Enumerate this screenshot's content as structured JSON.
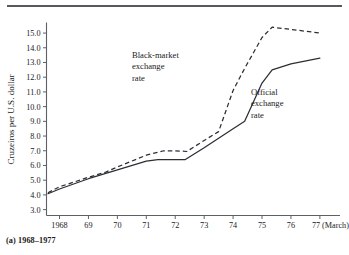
{
  "figure": {
    "caption": "(a) 1968–1977"
  },
  "chart_data": {
    "type": "line",
    "title": "",
    "xlabel": "",
    "ylabel": "Cruzeiros per U.S. dollar",
    "xtick_labels": [
      "1968",
      "69",
      "70",
      "71",
      "72",
      "73",
      "74",
      "75",
      "76",
      "77 (March)"
    ],
    "xticks": [
      1968,
      1969,
      1970,
      1971,
      1972,
      1973,
      1974,
      1975,
      1976,
      1977
    ],
    "ytick_labels": [
      "3.0",
      "4.0",
      "5.0",
      "6.0",
      "7.0",
      "8.0",
      "9.0",
      "10.0",
      "11.0",
      "12.0",
      "13.0",
      "14.0",
      "15.0"
    ],
    "yticks": [
      3.0,
      4.0,
      5.0,
      6.0,
      7.0,
      8.0,
      9.0,
      10.0,
      11.0,
      12.0,
      13.0,
      14.0,
      15.0
    ],
    "xlim": [
      1967.55,
      1977.35
    ],
    "ylim": [
      2.6,
      15.65
    ],
    "grid": false,
    "legend": "annotations-inline",
    "series": [
      {
        "name": "Black-market exchange rate",
        "style": "dashed",
        "x": [
          1967.6,
          1968.0,
          1969.0,
          1969.6,
          1970.0,
          1971.0,
          1971.6,
          1972.0,
          1972.4,
          1973.0,
          1973.5,
          1974.0,
          1974.4,
          1975.0,
          1975.35,
          1976.0,
          1977.0
        ],
        "y": [
          4.15,
          4.55,
          5.2,
          5.55,
          5.9,
          6.7,
          7.0,
          7.0,
          6.95,
          7.7,
          8.3,
          11.1,
          12.6,
          14.7,
          15.4,
          15.25,
          15.0
        ]
      },
      {
        "name": "Official exchange rate",
        "style": "solid",
        "x": [
          1967.6,
          1968.0,
          1969.0,
          1970.0,
          1971.0,
          1971.4,
          1972.0,
          1972.35,
          1973.0,
          1974.0,
          1974.4,
          1975.0,
          1975.35,
          1976.0,
          1977.0
        ],
        "y": [
          4.08,
          4.4,
          5.1,
          5.7,
          6.3,
          6.4,
          6.4,
          6.4,
          7.2,
          8.5,
          9.0,
          11.6,
          12.5,
          12.9,
          13.3
        ]
      }
    ],
    "annotations": [
      {
        "name": "black-market-label",
        "lines": [
          "Black-market",
          "exchange",
          "rate"
        ],
        "x_px": 132,
        "y_px": 58
      },
      {
        "name": "official-label",
        "lines": [
          "Official",
          "exchange",
          "rate"
        ],
        "x_px": 251,
        "y_px": 95
      }
    ]
  }
}
